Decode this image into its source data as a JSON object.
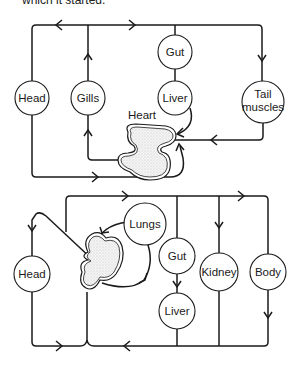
{
  "caption": "which it started.",
  "fish_diagram": {
    "title": "Single circulation (fish)",
    "nodes": {
      "head": "Head",
      "gills": "Gills",
      "gut": "Gut",
      "liver": "Liver",
      "tail": [
        "Tail",
        "muscles"
      ],
      "heart": "Heart"
    }
  },
  "mammal_diagram": {
    "title": "Double circulation (mammal)",
    "nodes": {
      "head": "Head",
      "lungs": "Lungs",
      "gut": "Gut",
      "liver": "Liver",
      "kidney": "Kidney",
      "body": "Body"
    }
  },
  "colors": {
    "line": "#1a1a1a",
    "background": "#ffffff"
  }
}
